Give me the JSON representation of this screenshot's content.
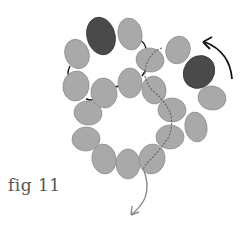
{
  "figure": {
    "label": "fig 11"
  },
  "colors": {
    "bead_light": "#a9a9a9",
    "bead_light_stroke": "#8f8f8f",
    "bead_dark": "#4a4a4a",
    "bead_dark_stroke": "#333333",
    "thread_hidden": "#777777",
    "thread_visible": "#111111",
    "arrow": "#111111",
    "tail_thread": "#8a8a8a"
  },
  "beads": [
    {
      "id": 1,
      "cx": 77,
      "cy": 54,
      "rx": 12,
      "ry": 15,
      "rot": -20,
      "tone": "light"
    },
    {
      "id": 2,
      "cx": 101,
      "cy": 36,
      "rx": 14,
      "ry": 19,
      "rot": -15,
      "tone": "dark"
    },
    {
      "id": 3,
      "cx": 130,
      "cy": 34,
      "rx": 12,
      "ry": 16,
      "rot": -10,
      "tone": "light"
    },
    {
      "id": 4,
      "cx": 150,
      "cy": 60,
      "rx": 14,
      "ry": 12,
      "rot": 10,
      "tone": "light"
    },
    {
      "id": 5,
      "cx": 178,
      "cy": 50,
      "rx": 12,
      "ry": 14,
      "rot": 20,
      "tone": "light"
    },
    {
      "id": 6,
      "cx": 199,
      "cy": 72,
      "rx": 15,
      "ry": 17,
      "rot": 35,
      "tone": "dark"
    },
    {
      "id": 7,
      "cx": 212,
      "cy": 98,
      "rx": 14,
      "ry": 12,
      "rot": 10,
      "tone": "light"
    },
    {
      "id": 8,
      "cx": 196,
      "cy": 127,
      "rx": 11,
      "ry": 15,
      "rot": -10,
      "tone": "light"
    },
    {
      "id": 9,
      "cx": 172,
      "cy": 110,
      "rx": 14,
      "ry": 12,
      "rot": 0,
      "tone": "light"
    },
    {
      "id": 10,
      "cx": 154,
      "cy": 90,
      "rx": 12,
      "ry": 14,
      "rot": -10,
      "tone": "light"
    },
    {
      "id": 11,
      "cx": 130,
      "cy": 83,
      "rx": 12,
      "ry": 15,
      "rot": 0,
      "tone": "light"
    },
    {
      "id": 12,
      "cx": 104,
      "cy": 93,
      "rx": 13,
      "ry": 15,
      "rot": -10,
      "tone": "light"
    },
    {
      "id": 13,
      "cx": 76,
      "cy": 86,
      "rx": 13,
      "ry": 15,
      "rot": 10,
      "tone": "light"
    },
    {
      "id": 14,
      "cx": 88,
      "cy": 113,
      "rx": 14,
      "ry": 12,
      "rot": 10,
      "tone": "light"
    },
    {
      "id": 15,
      "cx": 86,
      "cy": 139,
      "rx": 14,
      "ry": 12,
      "rot": -5,
      "tone": "light"
    },
    {
      "id": 16,
      "cx": 104,
      "cy": 159,
      "rx": 12,
      "ry": 15,
      "rot": -10,
      "tone": "light"
    },
    {
      "id": 17,
      "cx": 128,
      "cy": 164,
      "rx": 12,
      "ry": 15,
      "rot": 0,
      "tone": "light"
    },
    {
      "id": 18,
      "cx": 152,
      "cy": 159,
      "rx": 13,
      "ry": 15,
      "rot": 10,
      "tone": "light"
    },
    {
      "id": 19,
      "cx": 170,
      "cy": 137,
      "rx": 14,
      "ry": 12,
      "rot": 0,
      "tone": "light"
    }
  ]
}
